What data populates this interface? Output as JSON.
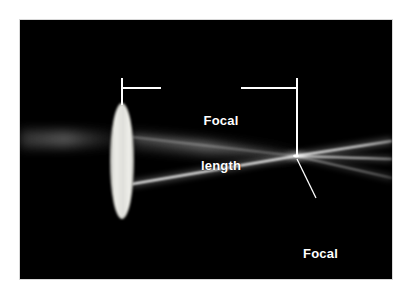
{
  "figure": {
    "kind": "optics-photograph-diagram",
    "background_color": "#ffffff",
    "plate_color": "#000000",
    "annotation_color": "#ffffff"
  },
  "annotations": {
    "focal_length": {
      "line1": "Focal",
      "line2": "length",
      "text": "Focal length"
    },
    "focal_point": {
      "line1": "Focal",
      "line2": "point",
      "text": "Focal point"
    }
  },
  "elements": {
    "lens_name": "convex-lens",
    "beam_names": [
      "upper-beam",
      "center-beam",
      "lower-beam"
    ],
    "dimension_line_name": "focal-length-dimension-line",
    "leader_line_name": "focal-point-leader-line"
  },
  "geometry": {
    "plate": {
      "x": 20,
      "y": 20,
      "width": 372,
      "height": 259
    },
    "lens": {
      "cx": 122,
      "cy": 161,
      "rx": 11,
      "ry": 57
    },
    "focal_point": {
      "x": 296,
      "y": 156
    },
    "dimension_rule_y": 88,
    "dimension_left_x": 122,
    "dimension_right_x": 300
  }
}
